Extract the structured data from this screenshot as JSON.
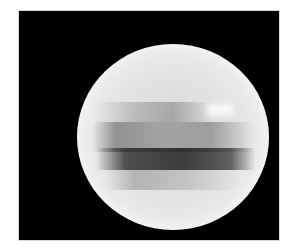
{
  "image": {
    "subject": "grayscale sphere with dark horizontal bands on black background",
    "background_color": "#000000",
    "frame_border_color": "#d8d8d8"
  }
}
